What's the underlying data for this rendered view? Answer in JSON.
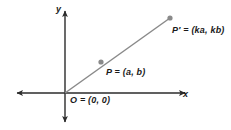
{
  "figure": {
    "type": "coordinate-plane-diagram",
    "background_color": "#ffffff",
    "axis_color": "#2b2b2b",
    "ray_color": "#8a8a8a",
    "point_color": "#8a8a8a",
    "text_color": "#1a1a1a",
    "axes": {
      "y_label": "y",
      "x_label": "x"
    },
    "labels": {
      "origin": "O = (0, 0)",
      "point_p": "P = (a, b)",
      "point_p_prime": "P′ = (ka, kb)"
    },
    "geometry": {
      "origin_px": [
        65,
        93
      ],
      "point_p_px": [
        101,
        62
      ],
      "point_p_prime_px": [
        170,
        18
      ],
      "x_axis_left_px": [
        13,
        93
      ],
      "x_axis_right_px": [
        188,
        93
      ],
      "y_axis_top_px": [
        65,
        8
      ],
      "y_axis_bottom_px": [
        65,
        126
      ]
    }
  }
}
